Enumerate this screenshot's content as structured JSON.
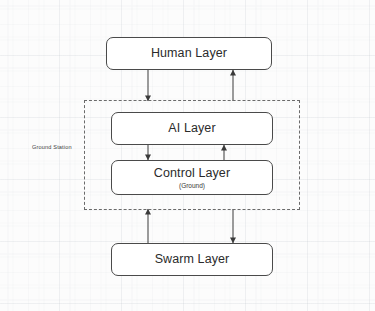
{
  "diagram": {
    "background_color": "#fcfcfc",
    "stroke_color": "#4a4a4a",
    "node_fill": "#ffffff",
    "nodes": [
      {
        "id": "human-layer",
        "label": "Human Layer",
        "subtitle": "",
        "x": 106,
        "y": 37,
        "width": 166,
        "height": 33
      },
      {
        "id": "ai-layer",
        "label": "AI Layer",
        "subtitle": "",
        "x": 111,
        "y": 112,
        "width": 162,
        "height": 33
      },
      {
        "id": "control-layer",
        "label": "Control Layer",
        "subtitle": "(Ground)",
        "x": 111,
        "y": 160,
        "width": 162,
        "height": 35
      },
      {
        "id": "swarm-layer",
        "label": "Swarm Layer",
        "subtitle": "",
        "x": 111,
        "y": 243,
        "width": 162,
        "height": 33
      }
    ],
    "groups": [
      {
        "id": "ground-station",
        "label": "Ground Station",
        "x": 84,
        "y": 100,
        "width": 216,
        "height": 110,
        "label_x": 32,
        "label_y": 144,
        "style": "dashed"
      }
    ],
    "connectors": [
      {
        "id": "human-to-ai",
        "from": "human-layer",
        "to": "ai-layer",
        "direction": "down",
        "x": 148,
        "y_start": 70,
        "y_end": 100
      },
      {
        "id": "ai-to-human",
        "from": "ai-layer",
        "to": "human-layer",
        "direction": "up",
        "x": 233,
        "y_start": 100,
        "y_end": 70
      },
      {
        "id": "ai-to-control",
        "from": "ai-layer",
        "to": "control-layer",
        "direction": "down",
        "x": 148,
        "y_start": 145,
        "y_end": 160
      },
      {
        "id": "control-to-ai",
        "from": "control-layer",
        "to": "ai-layer",
        "direction": "up",
        "x": 224,
        "y_start": 160,
        "y_end": 145
      },
      {
        "id": "swarm-to-ground",
        "from": "swarm-layer",
        "to": "ground-station",
        "direction": "up",
        "x": 148,
        "y_start": 243,
        "y_end": 210
      },
      {
        "id": "ground-to-swarm",
        "from": "ground-station",
        "to": "swarm-layer",
        "direction": "down",
        "x": 233,
        "y_start": 210,
        "y_end": 243
      }
    ]
  }
}
